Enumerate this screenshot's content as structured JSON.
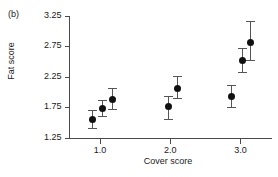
{
  "panel": {
    "label": "(b)"
  },
  "chart_data": {
    "type": "scatter",
    "title": "",
    "subtitle": "",
    "xlabel": "Cover score",
    "ylabel": "Fat score",
    "xlim": [
      0.55,
      3.45
    ],
    "ylim": [
      1.25,
      3.25
    ],
    "xticks": [
      "1.0",
      "2.0",
      "3.0"
    ],
    "xtick_values": [
      1.0,
      2.0,
      3.0
    ],
    "yticks": [
      "1.25",
      "1.75",
      "2.25",
      "2.75",
      "3.25"
    ],
    "ytick_values": [
      1.25,
      1.75,
      2.25,
      2.75,
      3.25
    ],
    "grid": false,
    "legend": "none",
    "error_bars": "vertical-with-caps",
    "marker_style": "filled-circle",
    "points": [
      {
        "x": 0.88,
        "y": 1.56,
        "yerr_low": 1.41,
        "yerr_high": 1.71
      },
      {
        "x": 1.03,
        "y": 1.74,
        "yerr_low": 1.61,
        "yerr_high": 1.87
      },
      {
        "x": 1.17,
        "y": 1.89,
        "yerr_low": 1.72,
        "yerr_high": 2.06
      },
      {
        "x": 1.97,
        "y": 1.77,
        "yerr_low": 1.55,
        "yerr_high": 1.93
      },
      {
        "x": 2.1,
        "y": 2.07,
        "yerr_low": 1.9,
        "yerr_high": 2.26
      },
      {
        "x": 2.87,
        "y": 1.93,
        "yerr_low": 1.76,
        "yerr_high": 2.11
      },
      {
        "x": 3.02,
        "y": 2.53,
        "yerr_low": 2.33,
        "yerr_high": 2.72
      },
      {
        "x": 3.14,
        "y": 2.82,
        "yerr_low": 2.52,
        "yerr_high": 3.16
      }
    ]
  }
}
